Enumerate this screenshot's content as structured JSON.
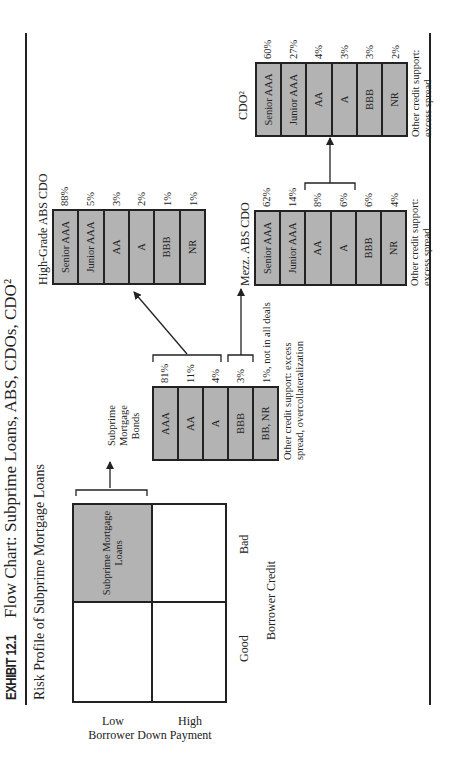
{
  "header": {
    "exhibit_label": "EXHIBIT 12.1",
    "title": "Flow Chart: Subprime Loans, ABS, CDOs, CDO²"
  },
  "risk_profile": {
    "title": "Risk Profile of Subprime Mortgage Loans",
    "y_axis_label": "Borrower Down Payment",
    "y_low": "Low",
    "y_high": "High",
    "x_axis_label": "Borrower Credit",
    "x_good": "Good",
    "x_bad": "Bad",
    "shaded_cell_label_line1": "Subprime Mortgage",
    "shaded_cell_label_line2": "Loans",
    "shade_color": "#b3b3b3"
  },
  "bonds": {
    "title_line1": "Subprime",
    "title_line2": "Mortgage",
    "title_line3": "Bonds",
    "tranches": [
      {
        "label": "AAA",
        "pct": "81%"
      },
      {
        "label": "AA",
        "pct": "11%"
      },
      {
        "label": "A",
        "pct": "4%"
      },
      {
        "label": "BBB",
        "pct": "3%"
      },
      {
        "label": "BB, NR",
        "pct": "1%, not in all deals"
      }
    ],
    "note_line1": "Other credit support: excess",
    "note_line2": "spread, overcollateralization"
  },
  "high_grade_cdo": {
    "title": "High-Grade ABS CDO",
    "tranches": [
      {
        "label": "Senior AAA",
        "pct": "88%"
      },
      {
        "label": "Junior AAA",
        "pct": "5%"
      },
      {
        "label": "AA",
        "pct": "3%"
      },
      {
        "label": "A",
        "pct": "2%"
      },
      {
        "label": "BBB",
        "pct": "1%"
      },
      {
        "label": "NR",
        "pct": "1%"
      }
    ]
  },
  "mezz_cdo": {
    "title": "Mezz. ABS CDO",
    "tranches": [
      {
        "label": "Senior AAA",
        "pct": "62%"
      },
      {
        "label": "Junior AAA",
        "pct": "14%"
      },
      {
        "label": "AA",
        "pct": "8%"
      },
      {
        "label": "A",
        "pct": "6%"
      },
      {
        "label": "BBB",
        "pct": "6%"
      },
      {
        "label": "NR",
        "pct": "4%"
      }
    ],
    "note_line1": "Other credit support:",
    "note_line2": "excess spread"
  },
  "cdo_squared": {
    "title": "CDO²",
    "tranches": [
      {
        "label": "Senior AAA",
        "pct": "60%"
      },
      {
        "label": "Junior AAA",
        "pct": "27%"
      },
      {
        "label": "AA",
        "pct": "4%"
      },
      {
        "label": "A",
        "pct": "3%"
      },
      {
        "label": "BBB",
        "pct": "3%"
      },
      {
        "label": "NR",
        "pct": "2%"
      }
    ],
    "note_line1": "Other credit support:",
    "note_line2": "excess spread"
  }
}
